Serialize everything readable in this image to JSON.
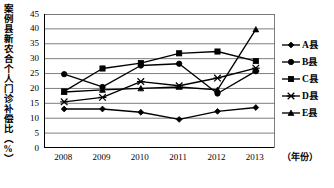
{
  "chart_data": {
    "type": "line",
    "title": "",
    "ylabel": "案例县新农合个人门诊补偿比（%）",
    "xlabel": "（年份）",
    "categories": [
      "2008",
      "2009",
      "2010",
      "2011",
      "2012",
      "2013"
    ],
    "ylim": [
      0,
      45
    ],
    "ytick_values": [
      "45",
      "40",
      "35",
      "30",
      "25",
      "20",
      "15",
      "10",
      "5",
      "0"
    ],
    "ytick_step": 5,
    "grid": true,
    "legend_position": "right",
    "series": [
      {
        "name": "A县",
        "marker": "diamond",
        "values": [
          13.1,
          13.1,
          12.0,
          9.6,
          12.3,
          13.6
        ]
      },
      {
        "name": "B县",
        "marker": "circle",
        "values": [
          24.8,
          20.5,
          27.7,
          28.3,
          18.3,
          25.8
        ]
      },
      {
        "name": "C县",
        "marker": "square",
        "values": [
          19.0,
          26.7,
          28.5,
          31.8,
          32.4,
          29.2
        ]
      },
      {
        "name": "D县",
        "marker": "x",
        "values": [
          15.5,
          17.0,
          22.3,
          20.9,
          23.5,
          26.8
        ]
      },
      {
        "name": "E县",
        "marker": "triangle",
        "values": [
          18.8,
          19.5,
          20.0,
          20.5,
          19.5,
          39.8
        ]
      }
    ]
  },
  "colors": {
    "ink": "#000000",
    "grid": "#6f6f6f",
    "background": "#ffffff"
  }
}
